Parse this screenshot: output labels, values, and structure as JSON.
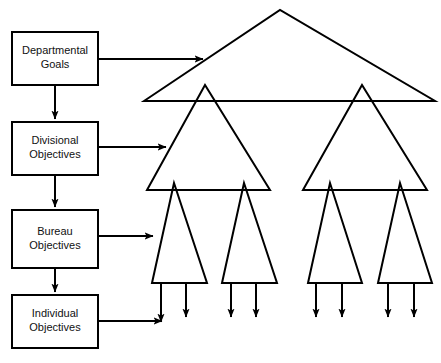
{
  "diagram": {
    "type": "organizational-cascade-diagram",
    "background_color": "#ffffff",
    "stroke_color": "#000000",
    "text_color": "#111111",
    "boxes": [
      {
        "id": "departmental-goals",
        "line1": "Departmental",
        "line2": "Goals",
        "x": 12,
        "y": 32,
        "w": 86,
        "h": 53
      },
      {
        "id": "divisional-objectives",
        "line1": "Divisional",
        "line2": "Objectives",
        "x": 12,
        "y": 122,
        "w": 86,
        "h": 53
      },
      {
        "id": "bureau-objectives",
        "line1": "Bureau",
        "line2": "Objectives",
        "x": 12,
        "y": 210,
        "w": 86,
        "h": 58
      },
      {
        "id": "individual-objectives",
        "line1": "Individual",
        "line2": "Objectives",
        "x": 12,
        "y": 295,
        "w": 86,
        "h": 53
      }
    ],
    "vertical_connectors": [
      {
        "id": "dept-to-div",
        "x": 55,
        "y1": 85,
        "y2": 119
      },
      {
        "id": "div-to-bureau",
        "x": 55,
        "y1": 175,
        "y2": 207
      },
      {
        "id": "bureau-to-indiv",
        "x": 55,
        "y1": 268,
        "y2": 292
      }
    ],
    "horizontal_connectors": [
      {
        "id": "dept-to-top-triangle",
        "x1": 98,
        "x2": 203,
        "y": 59
      },
      {
        "id": "div-to-level2-triangle",
        "x1": 98,
        "x2": 166,
        "y": 147
      },
      {
        "id": "bureau-to-level3-triangle",
        "x1": 98,
        "x2": 153,
        "y": 236
      },
      {
        "id": "indiv-to-arrow",
        "x1": 98,
        "x2": 162,
        "y": 321
      }
    ],
    "triangles": [
      {
        "id": "departmental-triangle",
        "level": 1,
        "apex_x": 280,
        "apex_y": 10,
        "left_x": 144,
        "right_x": 435,
        "base_y": 101
      },
      {
        "id": "divisional-triangle-left",
        "level": 2,
        "apex_x": 205,
        "apex_y": 85,
        "left_x": 147,
        "right_x": 270,
        "base_y": 190
      },
      {
        "id": "divisional-triangle-right",
        "level": 2,
        "apex_x": 362,
        "apex_y": 85,
        "left_x": 303,
        "right_x": 427,
        "base_y": 190
      },
      {
        "id": "bureau-triangle-1",
        "level": 3,
        "apex_x": 174,
        "apex_y": 183,
        "left_x": 152,
        "right_x": 207,
        "base_y": 283
      },
      {
        "id": "bureau-triangle-2",
        "level": 3,
        "apex_x": 244,
        "apex_y": 183,
        "left_x": 222,
        "right_x": 277,
        "base_y": 283
      },
      {
        "id": "bureau-triangle-3",
        "level": 3,
        "apex_x": 330,
        "apex_y": 183,
        "left_x": 308,
        "right_x": 362,
        "base_y": 283
      },
      {
        "id": "bureau-triangle-4",
        "level": 3,
        "apex_x": 400,
        "apex_y": 183,
        "left_x": 378,
        "right_x": 432,
        "base_y": 283
      }
    ],
    "individual_arrows": [
      {
        "id": "individual-arrow-1",
        "x": 161,
        "y1": 283,
        "y2": 322
      },
      {
        "id": "individual-arrow-2",
        "x": 186,
        "y1": 283,
        "y2": 317
      },
      {
        "id": "individual-arrow-3",
        "x": 231,
        "y1": 283,
        "y2": 317
      },
      {
        "id": "individual-arrow-4",
        "x": 256,
        "y1": 283,
        "y2": 317
      },
      {
        "id": "individual-arrow-5",
        "x": 316,
        "y1": 283,
        "y2": 317
      },
      {
        "id": "individual-arrow-6",
        "x": 342,
        "y1": 283,
        "y2": 317
      },
      {
        "id": "individual-arrow-7",
        "x": 388,
        "y1": 283,
        "y2": 317
      },
      {
        "id": "individual-arrow-8",
        "x": 414,
        "y1": 283,
        "y2": 317
      }
    ]
  }
}
